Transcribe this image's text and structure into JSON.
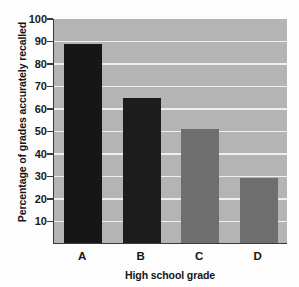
{
  "chart_data": {
    "type": "bar",
    "title": "",
    "categories": [
      "A",
      "B",
      "C",
      "D"
    ],
    "values": [
      88.5,
      64.5,
      50.5,
      29
    ],
    "xlabel": "High school grade",
    "ylabel": "Percentage of grades accurately recalled",
    "ylim": [
      0,
      100
    ],
    "yticks": [
      100,
      90,
      80,
      70,
      60,
      50,
      40,
      30,
      20,
      10
    ],
    "ytick_labels": [
      "100",
      "90",
      "80",
      "70",
      "60",
      "50",
      "40",
      "30",
      "20",
      "10"
    ],
    "grid": true,
    "grid_color": "#efefef",
    "legend": null,
    "plot_background": "#b4b4b4",
    "bar_colors": [
      "#161616",
      "#1c1c1c",
      "#6e6e6e",
      "#6e6e6e"
    ],
    "axis_color": "#3a3a3a"
  }
}
